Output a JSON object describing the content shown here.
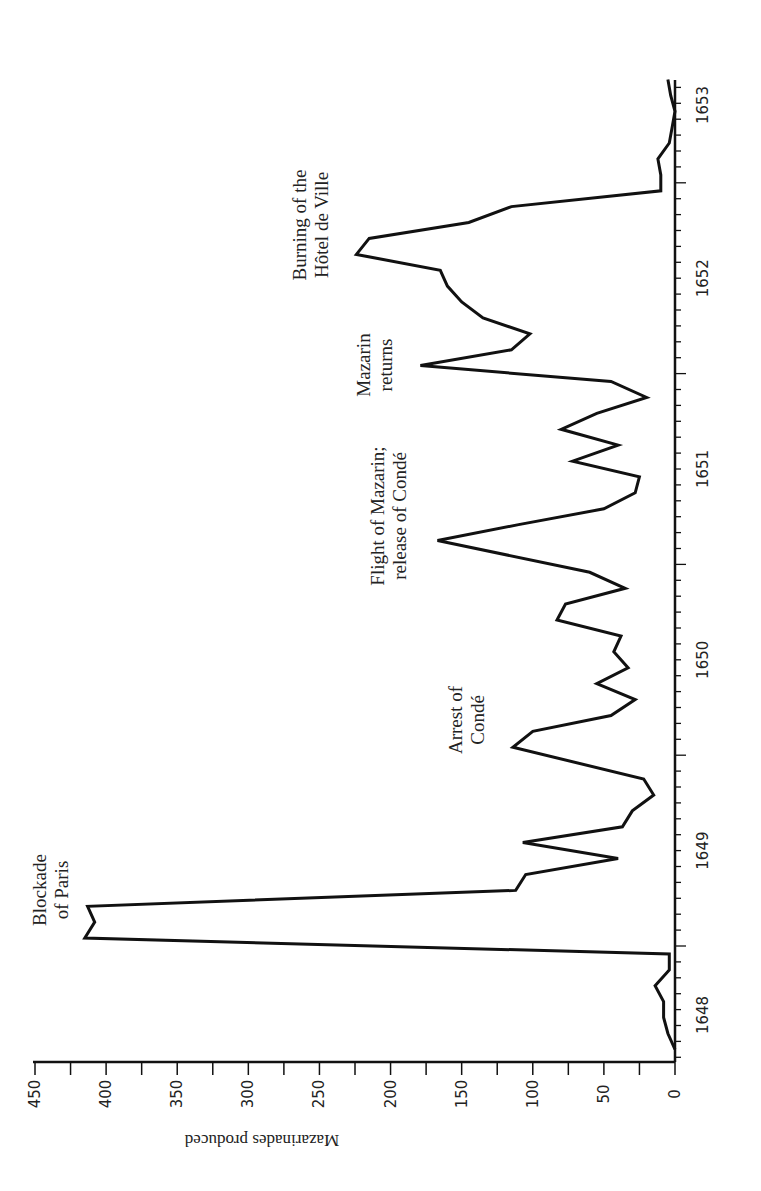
{
  "chart_data": {
    "type": "line",
    "orientation": "rotated-90-clockwise",
    "title": "",
    "xlabel": "",
    "ylabel": "Mazarinades produced",
    "ylim": [
      0,
      450
    ],
    "y_ticks": [
      0,
      50,
      100,
      150,
      200,
      250,
      300,
      350,
      400,
      450
    ],
    "x_ticks": [
      "1648",
      "1649",
      "1650",
      "1651",
      "1652",
      "1653"
    ],
    "grid": false,
    "legend": null,
    "series": [
      {
        "name": "Mazarinades produced",
        "points": [
          {
            "date": "1648-06",
            "value": 0
          },
          {
            "date": "1648-07",
            "value": 5
          },
          {
            "date": "1648-08",
            "value": 8
          },
          {
            "date": "1648-09",
            "value": 8
          },
          {
            "date": "1648-10",
            "value": 14
          },
          {
            "date": "1648-11",
            "value": 4
          },
          {
            "date": "1648-12",
            "value": 4
          },
          {
            "date": "1649-01",
            "value": 415
          },
          {
            "date": "1649-02",
            "value": 408
          },
          {
            "date": "1649-03",
            "value": 413
          },
          {
            "date": "1649-04",
            "value": 112
          },
          {
            "date": "1649-05",
            "value": 105
          },
          {
            "date": "1649-06",
            "value": 40
          },
          {
            "date": "1649-07",
            "value": 107
          },
          {
            "date": "1649-08",
            "value": 37
          },
          {
            "date": "1649-09",
            "value": 30
          },
          {
            "date": "1649-10",
            "value": 15
          },
          {
            "date": "1649-11",
            "value": 22
          },
          {
            "date": "1650-01",
            "value": 114
          },
          {
            "date": "1650-02",
            "value": 100
          },
          {
            "date": "1650-03",
            "value": 45
          },
          {
            "date": "1650-04",
            "value": 28
          },
          {
            "date": "1650-05",
            "value": 55
          },
          {
            "date": "1650-06",
            "value": 33
          },
          {
            "date": "1650-07",
            "value": 43
          },
          {
            "date": "1650-08",
            "value": 38
          },
          {
            "date": "1650-09",
            "value": 83
          },
          {
            "date": "1650-10",
            "value": 77
          },
          {
            "date": "1650-11",
            "value": 35
          },
          {
            "date": "1650-12",
            "value": 60
          },
          {
            "date": "1651-02",
            "value": 167
          },
          {
            "date": "1651-03",
            "value": 110
          },
          {
            "date": "1651-04",
            "value": 50
          },
          {
            "date": "1651-05",
            "value": 28
          },
          {
            "date": "1651-06",
            "value": 25
          },
          {
            "date": "1651-07",
            "value": 72
          },
          {
            "date": "1651-08",
            "value": 40
          },
          {
            "date": "1651-09",
            "value": 80
          },
          {
            "date": "1651-10",
            "value": 55
          },
          {
            "date": "1651-11",
            "value": 20
          },
          {
            "date": "1651-12",
            "value": 45
          },
          {
            "date": "1652-01",
            "value": 179
          },
          {
            "date": "1652-02",
            "value": 115
          },
          {
            "date": "1652-03",
            "value": 102
          },
          {
            "date": "1652-04",
            "value": 135
          },
          {
            "date": "1652-05",
            "value": 150
          },
          {
            "date": "1652-06",
            "value": 160
          },
          {
            "date": "1652-07",
            "value": 165
          },
          {
            "date": "1652-08",
            "value": 224
          },
          {
            "date": "1652-09",
            "value": 215
          },
          {
            "date": "1652-10",
            "value": 145
          },
          {
            "date": "1652-11",
            "value": 115
          },
          {
            "date": "1652-12",
            "value": 10
          },
          {
            "date": "1653-01",
            "value": 10
          },
          {
            "date": "1653-02",
            "value": 12
          },
          {
            "date": "1653-03",
            "value": 4
          },
          {
            "date": "1653-04",
            "value": 2
          },
          {
            "date": "1653-05",
            "value": 0
          },
          {
            "date": "1653-06",
            "value": 3
          },
          {
            "date": "1653-07",
            "value": 5
          }
        ]
      }
    ],
    "annotations": [
      {
        "lines": [
          "Blockade",
          "of Paris"
        ],
        "date": "1649-02"
      },
      {
        "lines": [
          "Arrest of",
          "Condé"
        ],
        "date": "1650-01"
      },
      {
        "lines": [
          "Flight of Mazarin;",
          "release of Condé"
        ],
        "date": "1651-02"
      },
      {
        "lines": [
          "Mazarin",
          "returns"
        ],
        "date": "1652-01"
      },
      {
        "lines": [
          "Burning of the",
          "Hôtel de Ville"
        ],
        "date": "1652-08"
      }
    ]
  },
  "labels": {
    "ylabel": "Mazarinades produced",
    "y_ticks": [
      "0",
      "50",
      "100",
      "150",
      "200",
      "250",
      "300",
      "350",
      "400",
      "450"
    ],
    "x_ticks": [
      "1648",
      "1649",
      "1650",
      "1651",
      "1652",
      "1653"
    ],
    "annot_blockade_1": "Blockade",
    "annot_blockade_2": "of Paris",
    "annot_arrest_1": "Arrest of",
    "annot_arrest_2": "Condé",
    "annot_flight_1": "Flight of Mazarin;",
    "annot_flight_2": "release of Condé",
    "annot_returns_1": "Mazarin",
    "annot_returns_2": "returns",
    "annot_burning_1": "Burning of the",
    "annot_burning_2": "Hôtel de Ville"
  }
}
